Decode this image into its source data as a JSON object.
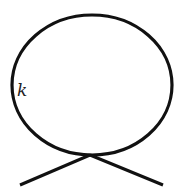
{
  "diagram": {
    "type": "feynman-tadpole",
    "loop_label": "k",
    "stroke_color": "#111111",
    "background": "#ffffff"
  }
}
